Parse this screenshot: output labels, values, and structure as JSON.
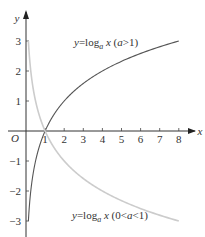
{
  "chart_data": {
    "type": "line",
    "title": "",
    "xlabel": "x",
    "ylabel": "y",
    "origin_label": "O",
    "xlim": [
      0,
      8.5
    ],
    "ylim": [
      -3.3,
      3.4
    ],
    "x_ticks": [
      1,
      2,
      3,
      4,
      5,
      6,
      7,
      8
    ],
    "x_tick_labels": [
      "1",
      "2",
      "3",
      "4",
      "5",
      "6",
      "7",
      "8"
    ],
    "y_ticks": [
      3,
      2,
      1,
      -1,
      -2,
      -3
    ],
    "y_tick_labels": [
      "3",
      "2",
      "1",
      "−1",
      "−2",
      "−3"
    ],
    "grid": false,
    "legend": "none (inline curve labels)",
    "series": [
      {
        "name": "y=log_a x (a>1)",
        "label_text": {
          "prefix": "y=log",
          "sub": "a",
          "suffix": " x (a>1)"
        },
        "color": "#555555",
        "base": 2,
        "x": [
          0.125,
          0.25,
          0.5,
          1,
          2,
          4,
          8
        ],
        "values": [
          -3,
          -2,
          -1,
          0,
          1,
          2,
          3
        ]
      },
      {
        "name": "y=log_a x (0<a<1)",
        "label_text": {
          "prefix": "y=log",
          "sub": "a",
          "suffix": " x (0<a<1)"
        },
        "color": "#cccccc",
        "base": 0.5,
        "x": [
          0.125,
          0.25,
          0.5,
          1,
          2,
          4,
          8
        ],
        "values": [
          3,
          2,
          1,
          0,
          -1,
          -2,
          -3
        ]
      }
    ]
  }
}
